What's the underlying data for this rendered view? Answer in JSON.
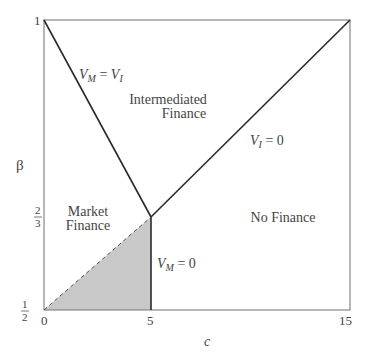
{
  "figure": {
    "y_axis_label": "β",
    "x_axis_label": "c",
    "y_ticks": {
      "top": "1",
      "mid_num": "2",
      "mid_den": "3",
      "bottom_num": "1",
      "bottom_den": "2"
    },
    "x_ticks": [
      "0",
      "5",
      "15"
    ],
    "regions": {
      "intermediated_line1": "Intermediated",
      "intermediated_line2": "Finance",
      "market_line1": "Market",
      "market_line2": "Finance",
      "no_finance": "No Finance"
    },
    "curves": {
      "vm_eq_vi": {
        "V": "V",
        "sub1": "M",
        "eq": " = ",
        "V2": "V",
        "sub2": "I"
      },
      "vi_zero": {
        "V": "V",
        "sub": "I",
        "rest": " = 0"
      },
      "vm_zero": {
        "V": "V",
        "sub": "M",
        "rest": " = 0"
      }
    },
    "colors": {
      "shaded": "#c8c8c8",
      "line": "#2a2a2a",
      "frame": "#888888"
    }
  }
}
